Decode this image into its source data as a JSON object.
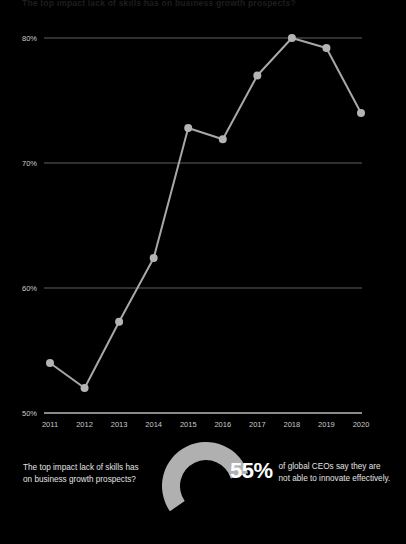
{
  "headline": "The top impact lack of skills has on business growth prospects?",
  "chart_data": {
    "type": "line",
    "title": "",
    "xlabel": "",
    "ylabel": "",
    "categories": [
      "2011",
      "2012",
      "2013",
      "2014",
      "2015",
      "2016",
      "2017",
      "2018",
      "2019",
      "2020"
    ],
    "values": [
      54.0,
      52.0,
      57.3,
      62.4,
      72.8,
      71.9,
      77.0,
      80.0,
      79.2,
      74.0
    ],
    "ytick_labels": [
      "50%",
      "60%",
      "70%",
      "80%"
    ],
    "ytick_values": [
      50,
      60,
      70,
      80
    ],
    "ylim": [
      50,
      80
    ],
    "grid": true,
    "legend": "none",
    "series_color": "#a8a8a8",
    "marker_color": "#b4b4b4",
    "grid_color": "#8a8a8a",
    "axis_color": "#b9b9b9",
    "background": "#000000"
  },
  "bottom": {
    "question_line1": "The top impact lack of skills has",
    "question_line2": "on business growth prospects?",
    "donut": {
      "name": "donut-chart",
      "percent": 55,
      "arc_color": "#b0b0b0",
      "track_color": "#000000"
    },
    "stat_number": "55%",
    "stat_desc_line1": "of global CEOs say they are",
    "stat_desc_line2": "not able to innovate effectively."
  }
}
